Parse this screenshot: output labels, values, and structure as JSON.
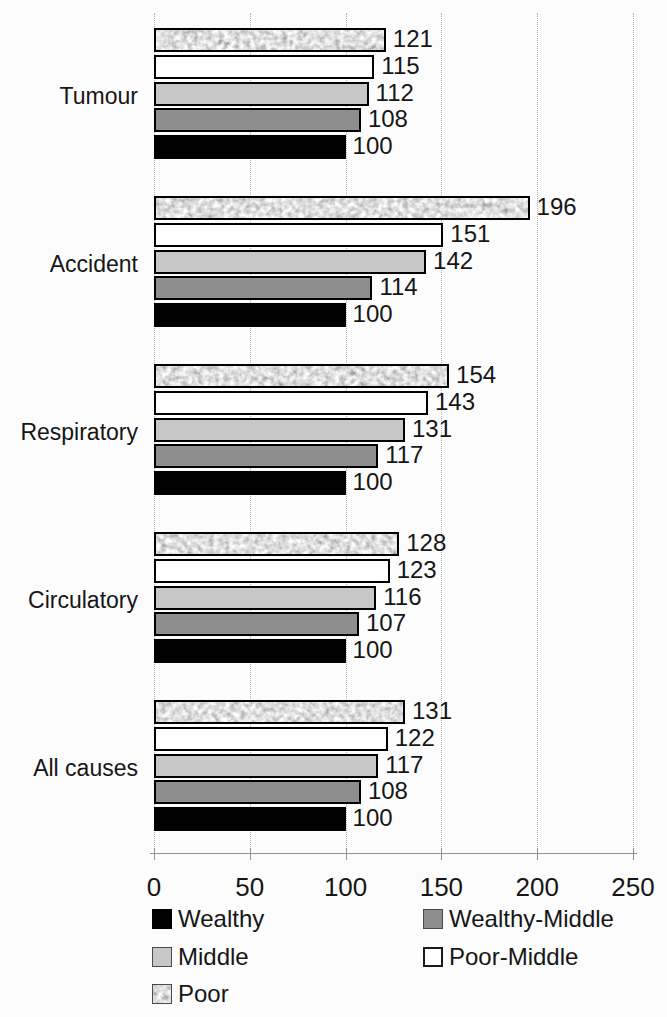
{
  "chart_data": {
    "type": "bar",
    "orientation": "horizontal",
    "title": "",
    "xlabel": "",
    "ylabel": "",
    "xlim": [
      0,
      250
    ],
    "xticks": [
      0,
      50,
      100,
      150,
      200,
      250
    ],
    "grid": true,
    "data_labels": true,
    "categories": [
      "Tumour",
      "Accident",
      "Respiratory",
      "Circulatory",
      "All causes"
    ],
    "series": [
      {
        "name": "Wealthy",
        "pattern": "solid",
        "fill": "#000000",
        "values": [
          100,
          100,
          100,
          100,
          100
        ]
      },
      {
        "name": "Wealthy-Middle",
        "pattern": "solid",
        "fill": "#8e8e8e",
        "values": [
          108,
          114,
          117,
          107,
          108
        ]
      },
      {
        "name": "Middle",
        "pattern": "solid",
        "fill": "#c7c7c7",
        "values": [
          112,
          142,
          131,
          116,
          117
        ]
      },
      {
        "name": "Poor-Middle",
        "pattern": "solid",
        "fill": "#ffffff",
        "values": [
          115,
          151,
          143,
          123,
          122
        ]
      },
      {
        "name": "Poor",
        "pattern": "speckle",
        "fill": "#c9c9c9",
        "values": [
          121,
          196,
          154,
          128,
          131
        ]
      }
    ],
    "bar_order_top_to_bottom": [
      "Poor",
      "Poor-Middle",
      "Middle",
      "Wealthy-Middle",
      "Wealthy"
    ],
    "legend": {
      "position": "bottom",
      "columns": 2,
      "entries": [
        "Wealthy",
        "Wealthy-Middle",
        "Middle",
        "Poor-Middle",
        "Poor"
      ]
    },
    "bar_outline_color": "#000000"
  }
}
